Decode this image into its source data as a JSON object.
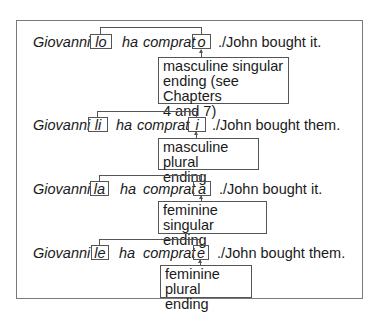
{
  "figure": {
    "rows": [
      {
        "subject": "Giovanni",
        "pronoun": "lo",
        "auxiliary": "ha",
        "participle_stem": "comprat",
        "ending": "o",
        "translation": "./John bought it.",
        "explanation": [
          "masculine singular",
          "ending (see Chapters",
          "4 and 7)"
        ]
      },
      {
        "subject": "Giovanni",
        "pronoun": "li",
        "auxiliary": "ha",
        "participle_stem": "comprat",
        "ending": "i",
        "translation": "./John bought them.",
        "explanation": [
          "masculine plural",
          "ending"
        ]
      },
      {
        "subject": "Giovanni",
        "pronoun": "la",
        "auxiliary": "ha",
        "participle_stem": "comprat",
        "ending": "a",
        "translation": "./John bought it.",
        "explanation": [
          "feminine singular",
          "ending"
        ]
      },
      {
        "subject": "Giovanni",
        "pronoun": "le",
        "auxiliary": "ha",
        "participle_stem": "comprat",
        "ending": "e",
        "translation": "./John bought them.",
        "explanation": [
          "feminine plural",
          "ending"
        ]
      }
    ]
  }
}
